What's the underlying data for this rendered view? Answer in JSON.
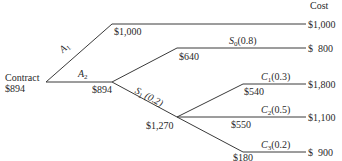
{
  "header": {
    "cost_label": "Cost"
  },
  "root": {
    "label": "Contract",
    "value": "$894"
  },
  "branches": {
    "a1": {
      "name": "A",
      "sub": "1",
      "node_value": "$1,000",
      "terminal_cost": "$1,000"
    },
    "a2": {
      "name": "A",
      "sub": "2",
      "node_value": "$894"
    },
    "s0": {
      "name": "S",
      "sub": "0",
      "prob": "(0.8)",
      "node_value": "$640",
      "terminal_cost": "$  800"
    },
    "s1": {
      "name": "S",
      "sub": "1",
      "prob": "(0.2)",
      "node_value": "$1,270"
    },
    "c1": {
      "name": "C",
      "sub": "1",
      "prob": "(0.3)",
      "node_value": "$540",
      "terminal_cost": "$1,800"
    },
    "c2": {
      "name": "C",
      "sub": "2",
      "prob": "(0.5)",
      "node_value": "$550",
      "terminal_cost": "$1,100"
    },
    "c3": {
      "name": "C",
      "sub": "3",
      "prob": "(0.2)",
      "node_value": "$180",
      "terminal_cost": "$  900"
    }
  },
  "colors": {
    "line": "#3a3a3a",
    "text": "#2a2a2a"
  }
}
